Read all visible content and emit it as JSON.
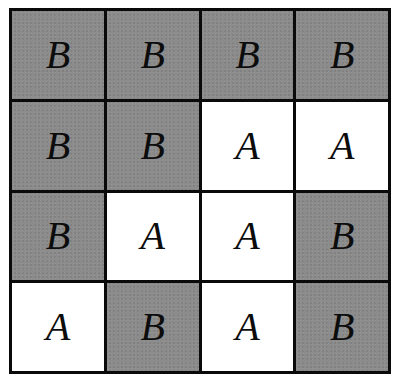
{
  "grid": {
    "rows": 4,
    "cols": 4,
    "colors": {
      "B": "#8c8c8c",
      "A": "#ffffff",
      "border": "#0a0a0a",
      "text": "#0c0c0c"
    },
    "cells": [
      [
        "B",
        "B",
        "B",
        "B"
      ],
      [
        "B",
        "B",
        "A",
        "A"
      ],
      [
        "B",
        "A",
        "A",
        "B"
      ],
      [
        "A",
        "B",
        "A",
        "B"
      ]
    ]
  }
}
